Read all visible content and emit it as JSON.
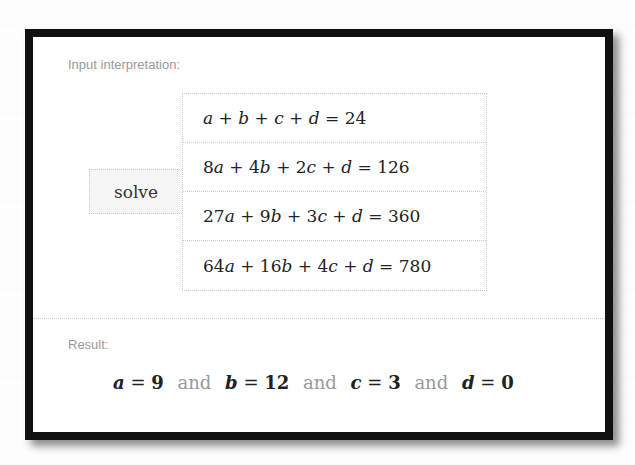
{
  "input_section": {
    "label": "Input interpretation:",
    "operation": "solve",
    "equations": [
      {
        "lhs_terms": [
          [
            "",
            "a"
          ],
          [
            "+",
            "b"
          ],
          [
            "+",
            "c"
          ],
          [
            "+",
            "d"
          ]
        ],
        "text": "a + b + c + d = 24",
        "rhs": "24"
      },
      {
        "text": "8 a + 4 b + 2 c + d = 126",
        "rhs": "126"
      },
      {
        "text": "27 a + 9 b + 3 c + d = 360",
        "rhs": "360"
      },
      {
        "text": "64 a + 16 b + 4 c + d = 780",
        "rhs": "780"
      }
    ]
  },
  "eq": {
    "r0": {
      "p1": "a",
      "o1": " + ",
      "p2": "b",
      "o2": " + ",
      "p3": "c",
      "o3": " + ",
      "p4": "d",
      "eq": " = 24"
    },
    "r1": {
      "c1": "8",
      "p1": "a",
      "o1": " + 4",
      "p2": "b",
      "o2": " + 2",
      "p3": "c",
      "o3": " + ",
      "p4": "d",
      "eq": " = 126"
    },
    "r2": {
      "c1": "27",
      "p1": "a",
      "o1": " + 9",
      "p2": "b",
      "o2": " + 3",
      "p3": "c",
      "o3": " + ",
      "p4": "d",
      "eq": " = 360"
    },
    "r3": {
      "c1": "64",
      "p1": "a",
      "o1": " + 16",
      "p2": "b",
      "o2": " + 4",
      "p3": "c",
      "o3": " + ",
      "p4": "d",
      "eq": " = 780"
    }
  },
  "result_section": {
    "label": "Result:",
    "conjunction": "and",
    "solutions": [
      {
        "var": "a",
        "value": "9"
      },
      {
        "var": "b",
        "value": "12"
      },
      {
        "var": "c",
        "value": "3"
      },
      {
        "var": "d",
        "value": "0"
      }
    ]
  },
  "colors": {
    "label_gray": "#9a9a9a",
    "frame_border": "#111111",
    "text": "#222222"
  }
}
